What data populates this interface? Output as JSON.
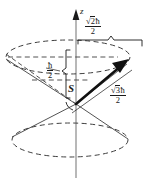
{
  "figure": {
    "name": "spin-angular-momentum-cone-diagram",
    "colors": {
      "stroke": "#1a1a1a",
      "dashed": "#4a4a4a",
      "axis": "#8a8a8a",
      "background": "#ffffff"
    }
  },
  "axis": {
    "z_label": "z"
  },
  "vector": {
    "label": "S"
  },
  "labels": {
    "projection_xy": {
      "radicand": "2",
      "numerator_symbol": "ħ",
      "denominator": "2"
    },
    "projection_z": {
      "numerator": "ħ",
      "denominator": "2"
    },
    "magnitude": {
      "radicand": "3",
      "numerator_symbol": "ħ",
      "denominator": "2"
    },
    "radical_sign": "√"
  }
}
